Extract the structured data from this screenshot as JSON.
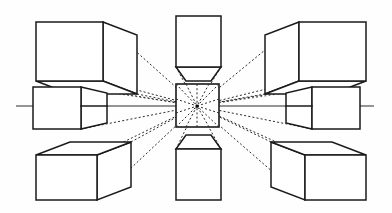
{
  "figure": {
    "background_color": "#fefefe",
    "ink_color": "#1a1a1a",
    "ray_color": "#2b2b2b",
    "width": 392,
    "height": 213
  },
  "vanishing_point": {
    "label": "VP",
    "x": 197,
    "y": 106,
    "dot_radius": 1.6
  },
  "horizon": {
    "label": "horizon-line",
    "y": 106,
    "x_start": 16,
    "x_end": 374,
    "color": "#2a2a2a"
  },
  "center_square": {
    "label": "vanishing-point-square",
    "x": 176,
    "y": 84,
    "width": 43,
    "height": 43
  },
  "cubes": [
    {
      "id": "cube-top-left",
      "position": "top-left",
      "visible_faces": [
        "front",
        "right",
        "bottom"
      ],
      "front_face": {
        "x": 36,
        "y": 22,
        "width": 67,
        "height": 59
      },
      "depth_x": 34,
      "depth_y": 13
    },
    {
      "id": "cube-top-center",
      "position": "top-center",
      "visible_faces": [
        "front",
        "bottom"
      ],
      "front_face": {
        "x": 176,
        "y": 16,
        "width": 45,
        "height": 51
      },
      "depth_x": 0,
      "depth_y": 14
    },
    {
      "id": "cube-top-right",
      "position": "top-right",
      "visible_faces": [
        "front",
        "left",
        "bottom"
      ],
      "front_face": {
        "x": 299,
        "y": 22,
        "width": 67,
        "height": 59
      },
      "depth_x": -34,
      "depth_y": 13
    },
    {
      "id": "cube-middle-left",
      "position": "middle-left",
      "visible_faces": [
        "front",
        "right"
      ],
      "front_face": {
        "x": 33,
        "y": 87,
        "width": 48,
        "height": 42
      },
      "depth_x": 26,
      "depth_y": 0
    },
    {
      "id": "cube-middle-right",
      "position": "middle-right",
      "visible_faces": [
        "front",
        "left"
      ],
      "front_face": {
        "x": 312,
        "y": 87,
        "width": 48,
        "height": 42
      },
      "depth_x": -26,
      "depth_y": 0
    },
    {
      "id": "cube-bottom-left",
      "position": "bottom-left",
      "visible_faces": [
        "front",
        "right",
        "top"
      ],
      "front_face": {
        "x": 36,
        "y": 155,
        "width": 61,
        "height": 45
      },
      "depth_x": 34,
      "depth_y": -13
    },
    {
      "id": "cube-bottom-center",
      "position": "bottom-center",
      "visible_faces": [
        "front",
        "top"
      ],
      "front_face": {
        "x": 176,
        "y": 149,
        "width": 45,
        "height": 51
      },
      "depth_x": 0,
      "depth_y": -14
    },
    {
      "id": "cube-bottom-right",
      "position": "bottom-right",
      "visible_faces": [
        "front",
        "left",
        "top"
      ],
      "front_face": {
        "x": 305,
        "y": 155,
        "width": 61,
        "height": 45
      },
      "depth_x": -34,
      "depth_y": -13
    }
  ],
  "ray_count": 20,
  "legend": {
    "solid_line": "cube edge",
    "dotted_line": "convergence ray to vanishing point",
    "thin_line": "horizon / eye level"
  }
}
